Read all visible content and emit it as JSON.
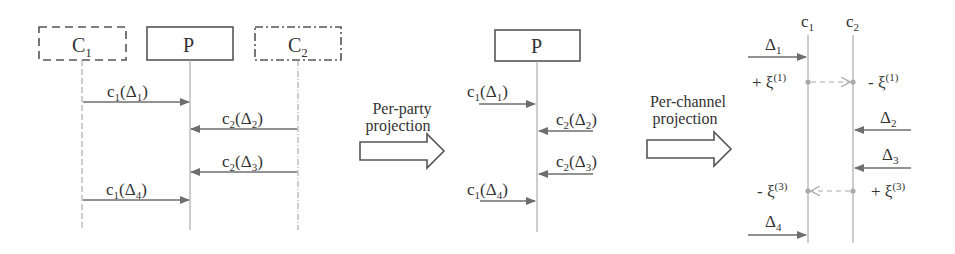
{
  "colors": {
    "box_stroke": "#555555",
    "lifeline": "#9a9a9a",
    "arrow": "#6e6e6e",
    "dashed_arrow": "#aaaaaa",
    "text": "#333333"
  },
  "panel_full": {
    "parties": [
      {
        "name": "C",
        "sub": "1",
        "style": "dashed"
      },
      {
        "name": "P",
        "sub": "",
        "style": "solid"
      },
      {
        "name": "C",
        "sub": "2",
        "style": "dashdot"
      }
    ],
    "messages": [
      {
        "channel": "c",
        "ch_sub": "1",
        "delta_sub": "1",
        "from": "C1",
        "to": "P"
      },
      {
        "channel": "c",
        "ch_sub": "2",
        "delta_sub": "2",
        "from": "C2",
        "to": "P"
      },
      {
        "channel": "c",
        "ch_sub": "2",
        "delta_sub": "3",
        "from": "C2",
        "to": "P"
      },
      {
        "channel": "c",
        "ch_sub": "1",
        "delta_sub": "4",
        "from": "C1",
        "to": "P"
      }
    ]
  },
  "transition_1": {
    "line1": "Per-party",
    "line2": "projection"
  },
  "panel_party": {
    "party": "P",
    "messages": [
      {
        "channel": "c",
        "ch_sub": "1",
        "delta_sub": "1",
        "dir": "in-left"
      },
      {
        "channel": "c",
        "ch_sub": "2",
        "delta_sub": "2",
        "dir": "in-right"
      },
      {
        "channel": "c",
        "ch_sub": "2",
        "delta_sub": "3",
        "dir": "in-right"
      },
      {
        "channel": "c",
        "ch_sub": "1",
        "delta_sub": "4",
        "dir": "in-left"
      }
    ]
  },
  "transition_2": {
    "line1": "Per-channel",
    "line2": "projection"
  },
  "panel_channel": {
    "channels": [
      {
        "name": "c",
        "sub": "1"
      },
      {
        "name": "c",
        "sub": "2"
      }
    ],
    "events": [
      {
        "label": "Δ",
        "sub": "1",
        "channel": "c1"
      },
      {
        "left_label": "+ ξ",
        "left_sup": "(1)",
        "right_label": "- ξ",
        "right_sup": "(1)",
        "type": "sync",
        "from": "c1",
        "to": "c2"
      },
      {
        "label": "Δ",
        "sub": "2",
        "channel": "c2"
      },
      {
        "label": "Δ",
        "sub": "3",
        "channel": "c2"
      },
      {
        "left_label": "- ξ",
        "left_sup": "(3)",
        "right_label": "+ ξ",
        "right_sup": "(3)",
        "type": "sync",
        "from": "c2",
        "to": "c1"
      },
      {
        "label": "Δ",
        "sub": "4",
        "channel": "c1"
      }
    ]
  }
}
